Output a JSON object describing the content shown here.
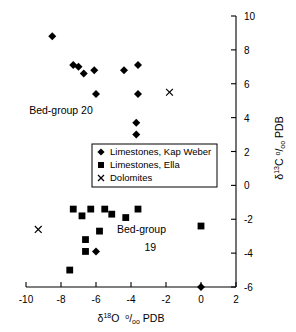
{
  "chart_data": {
    "type": "scatter",
    "title": "",
    "xlabel": "d18O  0/00 PDB",
    "ylabel": "d13C 0/00 PDB",
    "xlim": [
      -10,
      2
    ],
    "ylim": [
      -6,
      10
    ],
    "xticks": [
      -10,
      -8,
      -6,
      -4,
      -2,
      0,
      2
    ],
    "yticks": [
      -6,
      -4,
      -2,
      0,
      2,
      4,
      6,
      8,
      10
    ],
    "grid": false,
    "legend_position": "center",
    "series": [
      {
        "name": "Limestones, Kap Weber",
        "marker": "diamond",
        "color": "#000000",
        "points": [
          [
            -8.5,
            8.8
          ],
          [
            -7.3,
            7.1
          ],
          [
            -7.0,
            7.0
          ],
          [
            -6.7,
            6.6
          ],
          [
            -6.1,
            6.8
          ],
          [
            -4.4,
            6.8
          ],
          [
            -3.6,
            7.1
          ],
          [
            -6.0,
            5.4
          ],
          [
            -3.6,
            5.4
          ],
          [
            -3.7,
            3.7
          ],
          [
            -3.7,
            3.0
          ],
          [
            -6.0,
            -3.9
          ],
          [
            0.0,
            -6.0
          ]
        ]
      },
      {
        "name": "Limestones, Ella",
        "marker": "square",
        "color": "#000000",
        "points": [
          [
            -7.3,
            -1.4
          ],
          [
            -6.8,
            -1.8
          ],
          [
            -6.3,
            -1.4
          ],
          [
            -5.5,
            -1.4
          ],
          [
            -5.1,
            -1.7
          ],
          [
            -4.3,
            -1.9
          ],
          [
            -3.6,
            -1.4
          ],
          [
            -5.8,
            -2.7
          ],
          [
            -6.6,
            -3.2
          ],
          [
            -6.6,
            -3.9
          ],
          [
            -7.5,
            -5.0
          ],
          [
            0.0,
            -2.4
          ]
        ]
      },
      {
        "name": "Dolomites",
        "marker": "x",
        "color": "#000000",
        "points": [
          [
            -1.8,
            5.5
          ],
          [
            -9.3,
            -2.6
          ]
        ]
      }
    ],
    "annotations": [
      {
        "text": "Bed-group 20",
        "x": -8.0,
        "y": 4.2
      },
      {
        "text": "Bed-group",
        "x": -3.4,
        "y": -2.8
      },
      {
        "text": "19",
        "x": -2.9,
        "y": -3.9
      }
    ]
  },
  "axis": {
    "x_title_parts": {
      "delta": "δ",
      "sup": "18",
      "elem": "O",
      "permil": "°/₀₀",
      "ref": "PDB"
    },
    "y_title_parts": {
      "delta": "δ",
      "sup": "13",
      "elem": "C",
      "permil": "°/₀₀",
      "ref": "PDB"
    },
    "xtick_labels": [
      "-10",
      "-8",
      "-6",
      "-4",
      "-2",
      "0",
      "2"
    ],
    "ytick_labels": [
      "-6",
      "-4",
      "-2",
      "0",
      "2",
      "4",
      "6",
      "8",
      "10"
    ]
  },
  "legend": {
    "items": [
      {
        "label": "Limestones, Kap Weber",
        "marker": "diamond"
      },
      {
        "label": "Limestones, Ella",
        "marker": "square"
      },
      {
        "label": "Dolomites",
        "marker": "x"
      }
    ]
  }
}
